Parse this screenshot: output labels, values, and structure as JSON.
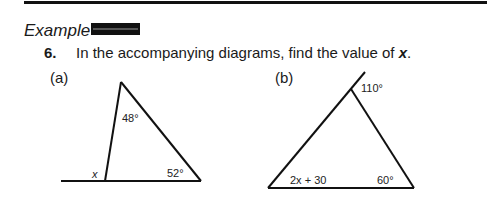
{
  "header": {
    "example_label": "Example"
  },
  "problem": {
    "number": "6.",
    "text": "In the accompanying diagrams, find the value of ",
    "variable": "x",
    "end": "."
  },
  "diagrams": [
    {
      "label": "(a)",
      "angles": {
        "apex": "48°",
        "base_right": "52°",
        "exterior": "x"
      }
    },
    {
      "label": "(b)",
      "angles": {
        "exterior_apex": "110°",
        "base_left": "2x + 30",
        "base_right": "60°"
      }
    }
  ]
}
